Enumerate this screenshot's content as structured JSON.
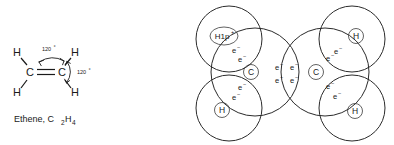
{
  "figure": {
    "background_color": "#ffffff",
    "line_color": "#2b2b2b"
  },
  "structural_formula": {
    "caption": "Ethene, C",
    "caption_sub1": "2",
    "caption_mid": "H",
    "caption_sub2": "4",
    "atoms": {
      "carbon_left": "C",
      "carbon_right": "C",
      "h_top_left": "H",
      "h_top_right": "H",
      "h_bottom_left": "H",
      "h_bottom_right": "H"
    },
    "angles": [
      {
        "label": "120",
        "degree_symbol": "°"
      },
      {
        "label": "120",
        "degree_symbol": "°"
      }
    ],
    "bond_type": "double"
  },
  "shell_diagram": {
    "carbon_left_label": "C",
    "carbon_right_label": "C",
    "hydrogens": [
      {
        "position": "top-left",
        "label": "H1p",
        "superscript": "+"
      },
      {
        "position": "top-right",
        "label": "H",
        "superscript": ""
      },
      {
        "position": "bottom-left",
        "label": "H",
        "superscript": ""
      },
      {
        "position": "bottom-right",
        "label": "H",
        "superscript": ""
      }
    ],
    "electron_symbol": "e",
    "electron_charge": "−",
    "bonding_pairs": [
      {
        "bond": "C-H top left",
        "count": 2
      },
      {
        "bond": "C-H bottom left",
        "count": 2
      },
      {
        "bond": "C-H top right",
        "count": 2
      },
      {
        "bond": "C-H bottom right",
        "count": 2
      },
      {
        "bond": "C=C double bond",
        "count": 4
      }
    ],
    "total_electrons_shown": 12
  }
}
